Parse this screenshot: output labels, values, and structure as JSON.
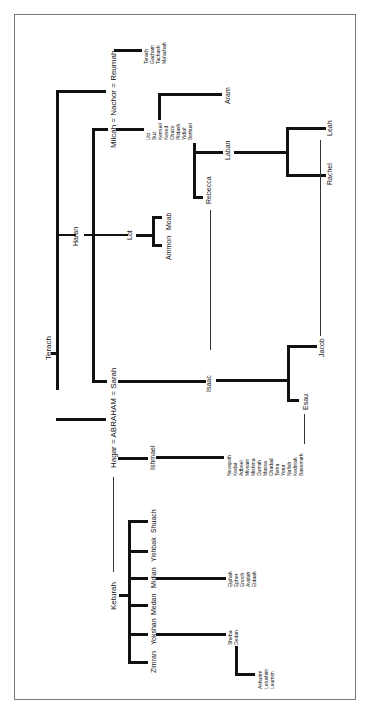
{
  "diagram": {
    "type": "genealogy-tree",
    "orientation": "rotated-90",
    "people": {
      "terach": "Terach",
      "haran": "Haran",
      "milcah": "Milcah",
      "nachor": "Nachor",
      "reumah": "Reumah",
      "abraham": "ABRAHAM",
      "sarah": "Sarah",
      "hagar": "Hagar",
      "keturah": "Keturah",
      "lot": "Lot",
      "moab": "Moab",
      "ammon": "Ammon",
      "aram": "Aram",
      "laban": "Laban",
      "rebecca": "Rebecca",
      "isaac": "Isaac",
      "ishmael": "Ishmael",
      "jacob": "Jacob",
      "esau": "Esau",
      "leah": "Leah",
      "rachel": "Rachel",
      "basemath": "Basemath"
    },
    "marriage_lines": {
      "top": "Milcah = Nachor = Reumah",
      "middle": "Hagar = ABRAHAM = Sarah"
    },
    "reumah_children": [
      "Terach",
      "Gacham",
      "Tachash",
      "Ma'achah"
    ],
    "nachor_milcah_children": [
      "Utz",
      "Buz",
      "Kemuel",
      "Kesed",
      "Chazo",
      "Pildash",
      "Yidlaf",
      "Bethuel"
    ],
    "ishmael_children": [
      "Nevayoth",
      "Kedar",
      "Adbeel",
      "Mivsam",
      "Mishma",
      "Dumah",
      "Massa",
      "Chadad",
      "Tema",
      "Yetur",
      "Nafish",
      "Kedmah",
      "Basemath"
    ],
    "keturah_children": [
      "Zimran",
      "Yokshan",
      "Medan",
      "Midian",
      "Yishbak",
      "Shuach"
    ],
    "midian_children": [
      "Eiphah",
      "Epher",
      "Enoch",
      "Avidah",
      "Eldaah"
    ],
    "yokshan_children": [
      "Sheba",
      "Dedan"
    ],
    "dedan_children": [
      "Ashurim",
      "Letushim",
      "Leumim"
    ]
  }
}
